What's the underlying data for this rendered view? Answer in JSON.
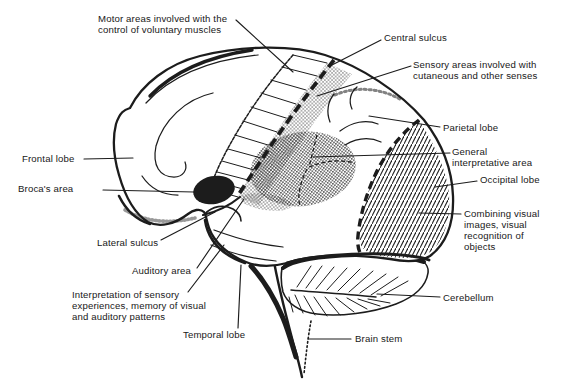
{
  "figure": {
    "colors": {
      "ink": "#1c1c1c",
      "paper": "#ffffff"
    },
    "labels": [
      {
        "id": "motor-areas",
        "text": "Motor areas involved with the\ncontrol of voluntary muscles"
      },
      {
        "id": "central-sulcus",
        "text": "Central sulcus"
      },
      {
        "id": "sensory-areas",
        "text": "Sensory areas involved with\ncutaneous and other senses"
      },
      {
        "id": "parietal-lobe",
        "text": "Parietal lobe"
      },
      {
        "id": "general-interpretative-area",
        "text": "General\ninterpretative area"
      },
      {
        "id": "occipital-lobe",
        "text": "Occipital lobe"
      },
      {
        "id": "combining-visual",
        "text": "Combining visual\nimages, visual\nrecognition of\nobjects"
      },
      {
        "id": "cerebellum",
        "text": "Cerebellum"
      },
      {
        "id": "brain-stem",
        "text": "Brain stem"
      },
      {
        "id": "temporal-lobe",
        "text": "Temporal lobe"
      },
      {
        "id": "interpretation",
        "text": "Interpretation of sensory\nexperiences, memory of visual\nand auditory patterns"
      },
      {
        "id": "auditory-area",
        "text": "Auditory area"
      },
      {
        "id": "lateral-sulcus",
        "text": "Lateral sulcus"
      },
      {
        "id": "brocas-area",
        "text": "Broca's area"
      },
      {
        "id": "frontal-lobe",
        "text": "Frontal lobe"
      }
    ]
  }
}
